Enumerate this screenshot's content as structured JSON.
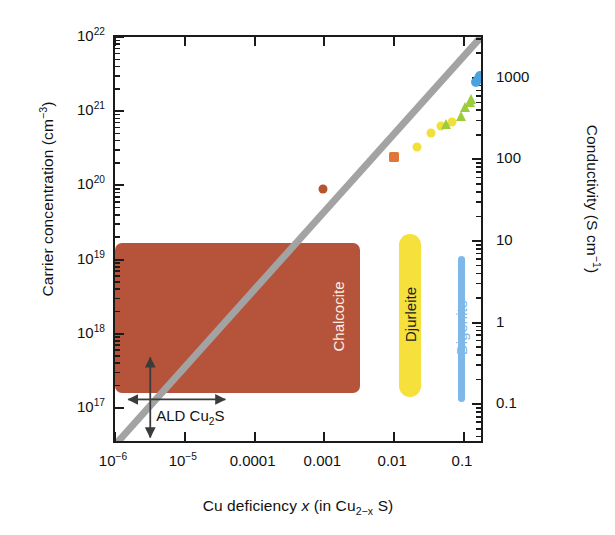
{
  "chart_data": {
    "type": "scatter",
    "title": "",
    "xlabel": "Cu deficiency x (in Cu2-x S)",
    "ylabel": "Carrier concentration (cm-3)",
    "y2label": "Conductivity (S cm-1)",
    "xlim": [
      1e-06,
      0.2
    ],
    "ylim": [
      3.16e+16,
      1e+22
    ],
    "y2lim": [
      0.0316,
      3162
    ],
    "xscale": "log",
    "yscale": "log",
    "grid": false,
    "legend": "none",
    "xticks": [
      {
        "value": 1e-06,
        "label": "10-6"
      },
      {
        "value": 1e-05,
        "label": "10-5"
      },
      {
        "value": 0.0001,
        "label": "0.0001"
      },
      {
        "value": 0.001,
        "label": "0.001"
      },
      {
        "value": 0.01,
        "label": "0.01"
      },
      {
        "value": 0.1,
        "label": "0.1"
      }
    ],
    "yticks": [
      {
        "value": 1e+17,
        "label": "1017"
      },
      {
        "value": 1e+18,
        "label": "1018"
      },
      {
        "value": 1e+19,
        "label": "1019"
      },
      {
        "value": 1e+20,
        "label": "1020"
      },
      {
        "value": 1e+21,
        "label": "1021"
      },
      {
        "value": 1e+22,
        "label": "1022"
      }
    ],
    "y2ticks": [
      {
        "value": 0.1,
        "label": "0.1"
      },
      {
        "value": 1,
        "label": "1"
      },
      {
        "value": 10,
        "label": "10"
      },
      {
        "value": 100,
        "label": "100"
      },
      {
        "value": 1000,
        "label": "1000"
      }
    ],
    "trendline": {
      "name": "stoichiometry trend",
      "color": "#a3a3a3",
      "width": 7,
      "x0": 1e-06,
      "y0": 3.16e+16,
      "x1": 0.175,
      "y1": 1e+22
    },
    "series": [
      {
        "name": "chalcocite points",
        "color": "#b5542f",
        "marker": "circle",
        "size": 9,
        "points": [
          {
            "x": 0.00095,
            "y": 9e+19
          }
        ]
      },
      {
        "name": "chalcocite square points",
        "color": "#e0763a",
        "marker": "square",
        "size": 10,
        "points": [
          {
            "x": 0.0098,
            "y": 2.4e+20
          }
        ]
      },
      {
        "name": "djurleite points",
        "color": "#f2e03a",
        "marker": "circle",
        "size": 9,
        "points": [
          {
            "x": 0.0215,
            "y": 3.3e+20
          },
          {
            "x": 0.034,
            "y": 5.1e+20
          },
          {
            "x": 0.047,
            "y": 6.4e+20
          },
          {
            "x": 0.068,
            "y": 7.2e+20
          }
        ]
      },
      {
        "name": "djurleite triangles",
        "color": "#9ccb3b",
        "marker": "triangle",
        "size": 10,
        "points": [
          {
            "x": 0.055,
            "y": 6.8e+20
          },
          {
            "x": 0.09,
            "y": 8.5e+20
          },
          {
            "x": 0.105,
            "y": 1.15e+21
          },
          {
            "x": 0.12,
            "y": 1.35e+21
          },
          {
            "x": 0.128,
            "y": 1.45e+21
          }
        ]
      },
      {
        "name": "digenite points",
        "color": "#4aa3e0",
        "marker": "circle",
        "size": 10,
        "points": [
          {
            "x": 0.15,
            "y": 2.5e+21
          },
          {
            "x": 0.163,
            "y": 2.8e+21
          },
          {
            "x": 0.172,
            "y": 3e+21
          }
        ]
      }
    ],
    "regions": [
      {
        "name": "Chalcocite",
        "label": "Chalcocite",
        "kind": "box",
        "fill": "#b5543b",
        "text_color": "#fdeee4",
        "x_from": 1e-06,
        "x_to": 0.0032,
        "y_from": 1.6e+17,
        "y_to": 1.65e+19
      },
      {
        "name": "Djurleite",
        "label": "Djurleite",
        "kind": "bar",
        "fill": "#f5e03c",
        "text_color": "#1a1a1a",
        "x_at": 0.0215,
        "y_from": 1.4e+17,
        "y_to": 2.2e+19
      },
      {
        "name": "Digenite",
        "label": "Digenite",
        "kind": "bar",
        "fill": "#7db8e8",
        "text_color": "#7db8e8",
        "x_at": 0.058,
        "y_from": 1.2e+17,
        "y_to": 1.1e+19
      }
    ],
    "annotations": [
      {
        "name": "ALD Cu2S",
        "label": "ALD Cu2S",
        "x": 3.2e-06,
        "y": 1.3e+17,
        "arrows": [
          "up",
          "right",
          "down"
        ]
      }
    ]
  },
  "axes": {
    "y_title_prefix": "Carrier concentration (cm",
    "y_title_sup": "−3",
    "y_title_suffix": ")",
    "y2_title_prefix": "Conductivity (S cm",
    "y2_title_sup": "−1",
    "y2_title_suffix": ")",
    "x_title_a": "Cu deficiency ",
    "x_title_x": "x",
    "x_title_b": " (in Cu",
    "x_title_sub": "2−x",
    "x_title_c": " S)"
  },
  "xticks_text": [
    {
      "base": "10",
      "exp": "−6",
      "plain": ""
    },
    {
      "base": "10",
      "exp": "−5",
      "plain": ""
    },
    {
      "base": "",
      "exp": "",
      "plain": "0.0001"
    },
    {
      "base": "",
      "exp": "",
      "plain": "0.001"
    },
    {
      "base": "",
      "exp": "",
      "plain": "0.01"
    },
    {
      "base": "",
      "exp": "",
      "plain": "0.1"
    }
  ],
  "yticks_text": [
    {
      "base": "10",
      "exp": "17"
    },
    {
      "base": "10",
      "exp": "18"
    },
    {
      "base": "10",
      "exp": "19"
    },
    {
      "base": "10",
      "exp": "20"
    },
    {
      "base": "10",
      "exp": "21"
    },
    {
      "base": "10",
      "exp": "22"
    }
  ],
  "y2ticks_text": [
    "0.1",
    "1",
    "10",
    "100",
    "1000"
  ],
  "labels": {
    "chalcocite": "Chalcocite",
    "djurleite": "Djurleite",
    "digenite": "Digenite",
    "ald_a": "ALD Cu",
    "ald_sub": "2",
    "ald_b": "S"
  },
  "colors": {
    "chalcocite_fill": "#b5543b",
    "chalcocite_text": "#fdeee4",
    "djurleite_fill": "#f5e03c",
    "djurleite_text": "#1a1a1a",
    "digenite_fill": "#7db8e8",
    "digenite_text": "#7db8e8",
    "trendline": "#a3a3a3",
    "axis": "#1a1a1a",
    "point_brown": "#b5542f",
    "point_orange": "#e0763a",
    "point_yellow": "#f2e03a",
    "point_green": "#9ccb3b",
    "point_blue": "#4aa3e0"
  }
}
